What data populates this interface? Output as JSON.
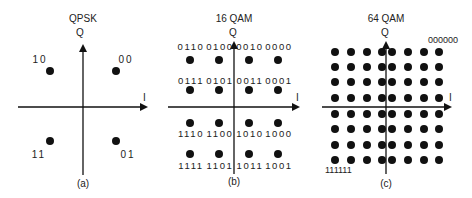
{
  "figure": {
    "panels": [
      {
        "id": "qpsk",
        "title": "QPSK",
        "caption": "(a)",
        "axis_i": "I",
        "axis_q": "Q",
        "points": [
          {
            "label": "10",
            "col": -1,
            "row": 1
          },
          {
            "label": "00",
            "col": 1,
            "row": 1
          },
          {
            "label": "11",
            "col": -1,
            "row": -1
          },
          {
            "label": "01",
            "col": 1,
            "row": -1
          }
        ]
      },
      {
        "id": "16qam",
        "title": "16 QAM",
        "caption": "(b)",
        "axis_i": "I",
        "axis_q": "Q",
        "labels_rows": [
          [
            "0110",
            "0100",
            "0010",
            "0000"
          ],
          [
            "0111",
            "0101",
            "0011",
            "0001"
          ],
          [
            "1110",
            "1100",
            "1010",
            "1000"
          ],
          [
            "1111",
            "1101",
            "1011",
            "1001"
          ]
        ]
      },
      {
        "id": "64qam",
        "title": "64 QAM",
        "caption": "(c)",
        "axis_i": "I",
        "axis_q": "Q",
        "grid": "8x8",
        "corner_labels": {
          "top_right": "000000",
          "bottom_left": "111111"
        }
      }
    ]
  },
  "colors": {
    "ink": "#111111",
    "text": "#222222",
    "background": "#ffffff"
  }
}
